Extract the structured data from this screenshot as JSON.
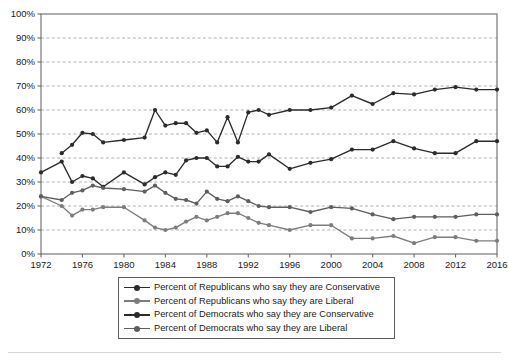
{
  "chart_data": {
    "type": "line",
    "title": "",
    "subtitle": "",
    "xlabel": "",
    "ylabel": "",
    "xlim": [
      1972,
      2016
    ],
    "ylim": [
      0,
      100
    ],
    "grid": true,
    "legend_position": "bottom",
    "x": [
      1972,
      1974,
      1975,
      1976,
      1977,
      1978,
      1980,
      1982,
      1983,
      1984,
      1985,
      1986,
      1987,
      1988,
      1989,
      1990,
      1991,
      1992,
      1993,
      1994,
      1996,
      1998,
      2000,
      2002,
      2004,
      2006,
      2008,
      2010,
      2012,
      2014,
      2016
    ],
    "x_ticks": [
      1972,
      1976,
      1980,
      1984,
      1988,
      1992,
      1996,
      2000,
      2004,
      2008,
      2012,
      2016
    ],
    "y_ticks": [
      0,
      10,
      20,
      30,
      40,
      50,
      60,
      70,
      80,
      90,
      100
    ],
    "y_tick_labels": [
      "0%",
      "10%",
      "20%",
      "30%",
      "40%",
      "50%",
      "60%",
      "70%",
      "80%",
      "90%",
      "100%"
    ],
    "series": [
      {
        "name": "Percent of Republicans who say they are Conservative",
        "key": "rep_conservative",
        "color": "#2b2b2b",
        "values": [
          null,
          42,
          45.5,
          50.5,
          50,
          46.5,
          47.5,
          48.5,
          60,
          53.5,
          54.5,
          54.5,
          50.5,
          51.5,
          46.5,
          57,
          46.5,
          59,
          60,
          58,
          60,
          60,
          61,
          66,
          62.5,
          67,
          66.5,
          68.5,
          69.5,
          68.5,
          68.5
        ]
      },
      {
        "name": "Percent of Republicans who say they are Liberal",
        "key": "rep_liberal",
        "color": "#7d7d7d",
        "values": [
          24,
          20,
          16,
          18.5,
          18.5,
          19.5,
          19.5,
          14,
          11,
          10,
          11,
          13.5,
          15.5,
          14,
          15.5,
          17,
          17,
          15,
          13,
          12,
          10,
          12,
          12,
          6.5,
          6.5,
          7.5,
          4.5,
          7,
          7,
          5.5,
          5.5
        ]
      },
      {
        "name": "Percent of Democrats who say they are Conservative",
        "key": "dem_conservative",
        "color": "#2b2b2b",
        "values": [
          34,
          38.5,
          30,
          32.5,
          31.5,
          28,
          34,
          29,
          32,
          34,
          33,
          39,
          40,
          40,
          36.5,
          36.5,
          40.5,
          38.5,
          38.5,
          41.5,
          35.5,
          38,
          39.5,
          43.5,
          43.5,
          47,
          44,
          42,
          42,
          47,
          47
        ]
      },
      {
        "name": "Percent of Democrats who say they are Liberal",
        "key": "dem_liberal",
        "color": "#5e5e5e",
        "values": [
          24,
          22.5,
          25.5,
          26.5,
          28.5,
          27.5,
          27,
          26,
          28.5,
          25.5,
          23,
          22.5,
          21,
          26,
          23,
          22,
          24,
          22,
          20,
          19.5,
          19.5,
          17.5,
          19.5,
          19,
          16.5,
          14.5,
          15.5,
          15.5,
          15.5,
          16.5,
          16.5
        ]
      }
    ]
  },
  "legend": {
    "items": [
      {
        "label": "Percent of Republicans who say they are Conservative",
        "color": "#2b2b2b",
        "icon": "line-marker-icon"
      },
      {
        "label": "Percent of Republicans who say they are Liberal",
        "color": "#7d7d7d",
        "icon": "line-marker-icon"
      },
      {
        "label": "Percent of Democrats who say they are Conservative",
        "color": "#2b2b2b",
        "icon": "line-marker-icon"
      },
      {
        "label": "Percent of Democrats who say they are Liberal",
        "color": "#5e5e5e",
        "icon": "line-marker-icon"
      }
    ]
  }
}
